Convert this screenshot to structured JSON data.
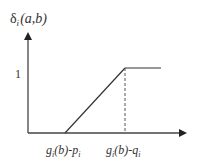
{
  "diagram": {
    "y_axis_label": {
      "symbol": "δ",
      "subscript": "i",
      "args": "(a,b)"
    },
    "y_tick_label": "1",
    "x_tick_labels": [
      {
        "main": "g",
        "sub": "i",
        "mid": "(b)-p",
        "sub2": "i"
      },
      {
        "main": "g",
        "sub": "i",
        "mid": "(b)-q",
        "sub2": "i"
      }
    ],
    "colors": {
      "line": "#333333",
      "dashed": "#555555"
    }
  }
}
